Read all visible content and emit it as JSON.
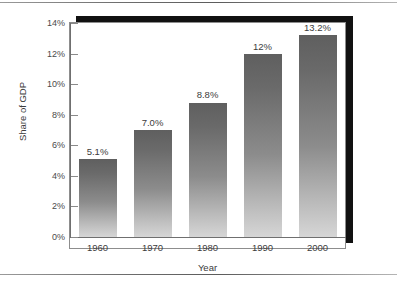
{
  "chart_data": {
    "type": "bar",
    "title": "",
    "xlabel": "Year",
    "ylabel": "Share of GDP",
    "categories": [
      "1960",
      "1970",
      "1980",
      "1990",
      "2000"
    ],
    "values": [
      5.1,
      7.0,
      8.8,
      12.0,
      13.2
    ],
    "data_labels": [
      "5.1%",
      "7.0%",
      "8.8%",
      "12%",
      "13.2%"
    ],
    "ylim": [
      0,
      14
    ],
    "ytick_values": [
      0,
      2,
      4,
      6,
      8,
      10,
      12,
      14
    ],
    "ytick_labels": [
      "0%",
      "2%",
      "4%",
      "6%",
      "8%",
      "10%",
      "12%",
      "14%"
    ],
    "grid": false,
    "legend": false,
    "legend_position": "none",
    "bar_color_top": "#5f5f5f",
    "bar_color_bottom": "#d6d6d6",
    "frame_shadow_color": "#111111",
    "axis_color": "#6f6f6f",
    "background": "#ffffff"
  }
}
